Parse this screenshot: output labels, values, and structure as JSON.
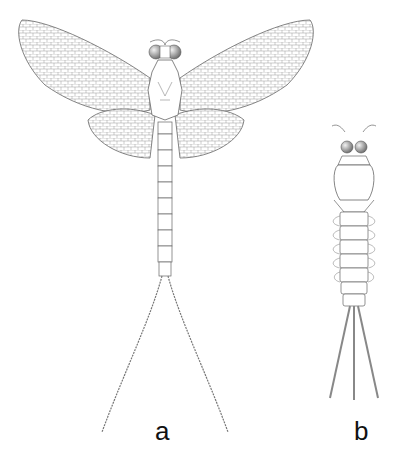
{
  "figure": {
    "panels": [
      {
        "id": "a",
        "label": "a",
        "subject": "adult mayfly (imago), dorsal view, wings spread, two long cerci"
      },
      {
        "id": "b",
        "label": "b",
        "subject": "mayfly nymph (larva), dorsal view, three caudal filaments"
      }
    ],
    "colors": {
      "line": "#555555",
      "background": "#ffffff",
      "eye": "#888888"
    }
  }
}
